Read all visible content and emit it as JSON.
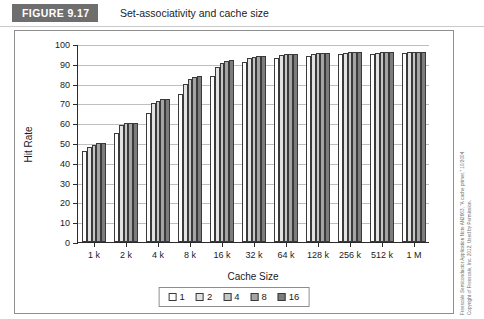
{
  "figure": {
    "tag": "FIGURE 9.17",
    "caption": "Set-associativity and cache size"
  },
  "credit": {
    "line1": "Freescale Semiconductor Application Note AN2663, \"A cache primer,\" 10/2004",
    "line2": "Copyright of Freescale, Inc. 2012; Used by Permission."
  },
  "legend": {
    "position": "bottom-center",
    "items": [
      {
        "label": "1",
        "color": "#fdfdfd"
      },
      {
        "label": "2",
        "color": "#e2e2e2"
      },
      {
        "label": "4",
        "color": "#c6c6c6"
      },
      {
        "label": "8",
        "color": "#a4a4a4"
      },
      {
        "label": "16",
        "color": "#7c7c7c"
      }
    ]
  },
  "chart_data": {
    "type": "bar",
    "title": "Set-associativity and cache size",
    "xlabel": "Cache Size",
    "ylabel": "Hit Rate",
    "ylim": [
      0,
      100
    ],
    "yticks": [
      0,
      10,
      20,
      30,
      40,
      50,
      60,
      70,
      80,
      90,
      100
    ],
    "grid": true,
    "categories": [
      "1 k",
      "2 k",
      "4 k",
      "8 k",
      "16 k",
      "32 k",
      "64 k",
      "128 k",
      "256 k",
      "512 k",
      "1 M"
    ],
    "series": [
      {
        "name": "1",
        "color": "#fdfdfd",
        "values": [
          46,
          55,
          65,
          75,
          84,
          91,
          93,
          94,
          95,
          95,
          95.5
        ]
      },
      {
        "name": "2",
        "color": "#e2e2e2",
        "values": [
          48,
          59,
          70,
          80,
          88.5,
          93,
          94.5,
          95,
          95.5,
          95.5,
          96
        ]
      },
      {
        "name": "4",
        "color": "#c6c6c6",
        "values": [
          49,
          60,
          71,
          82.5,
          90.5,
          93.5,
          95,
          95.5,
          96,
          96,
          96
        ]
      },
      {
        "name": "8",
        "color": "#a4a4a4",
        "values": [
          50,
          60,
          72,
          83.5,
          91.5,
          94,
          95,
          95.5,
          96,
          96,
          96
        ]
      },
      {
        "name": "16",
        "color": "#7c7c7c",
        "values": [
          50,
          60,
          72,
          84,
          92,
          94,
          95,
          95.5,
          96,
          96,
          96
        ]
      }
    ]
  }
}
